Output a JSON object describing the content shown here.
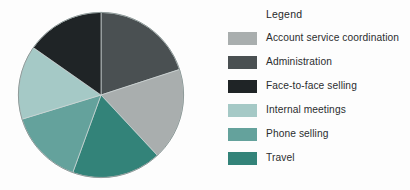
{
  "legend": {
    "title": "Legend",
    "items": [
      {
        "label": "Account service coordination",
        "color": "#a9aeae"
      },
      {
        "label": "Administration",
        "color": "#4a5052"
      },
      {
        "label": "Face-to-face selling",
        "color": "#1f2426"
      },
      {
        "label": "Internal meetings",
        "color": "#a5c9c6"
      },
      {
        "label": "Phone selling",
        "color": "#64a29c"
      },
      {
        "label": "Travel",
        "color": "#338379"
      }
    ]
  },
  "chart_data": {
    "type": "pie",
    "title": "",
    "legend_title": "Legend",
    "legend_position": "right",
    "start_angle": 0,
    "direction": "clockwise",
    "categories": [
      "Administration",
      "Account service coordination",
      "Travel",
      "Phone selling",
      "Internal meetings",
      "Face-to-face selling"
    ],
    "values": [
      20,
      18,
      17.5,
      15,
      14.5,
      15
    ],
    "colors": [
      "#4a5052",
      "#a9aeae",
      "#338379",
      "#64a29c",
      "#a5c9c6",
      "#1f2426"
    ],
    "slices": [
      {
        "label": "Administration",
        "value": 20,
        "color": "#4a5052",
        "start_deg": 0,
        "end_deg": 72
      },
      {
        "label": "Account service coordination",
        "value": 18,
        "color": "#a9aeae",
        "start_deg": 72,
        "end_deg": 137
      },
      {
        "label": "Travel",
        "value": 17.5,
        "color": "#338379",
        "start_deg": 137,
        "end_deg": 200
      },
      {
        "label": "Phone selling",
        "value": 15,
        "color": "#64a29c",
        "start_deg": 200,
        "end_deg": 253
      },
      {
        "label": "Internal meetings",
        "value": 14.5,
        "color": "#a5c9c6",
        "start_deg": 253,
        "end_deg": 305
      },
      {
        "label": "Face-to-face selling",
        "value": 15,
        "color": "#1f2426",
        "start_deg": 305,
        "end_deg": 360
      }
    ]
  }
}
